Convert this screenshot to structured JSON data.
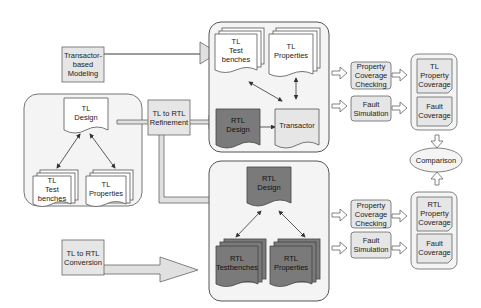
{
  "diagram": {
    "left_group": {
      "design": "TL\nDesign",
      "testbenches": "TL\nTest\nbenches",
      "properties": "TL\nProperties"
    },
    "process_boxes": {
      "transactor_modeling": "Transactor-\nbased\nModeling",
      "refinement": "TL to RTL\nRefinement",
      "conversion": "TL to RTL\nConversion"
    },
    "top_group": {
      "testbenches": "TL\nTest\nbenches",
      "properties": "TL\nProperties",
      "rtl_design": "RTL\nDesign",
      "transactor": "Transactor"
    },
    "bottom_group": {
      "rtl_design": "RTL\nDesign",
      "testbenches": "RTL\nTestbenches",
      "properties": "RTL\nProperties"
    },
    "analysis_top": {
      "property_checking": "Property\nCoverage\nChecking",
      "fault_simulation": "Fault\nSimulation"
    },
    "analysis_bottom": {
      "property_checking": "Property\nCoverage\nChecking",
      "fault_simulation": "Fault\nSimulation"
    },
    "results_top": {
      "property_coverage": "TL\nProperty\nCoverage",
      "fault_coverage": "Fault\nCoverage"
    },
    "results_bottom": {
      "property_coverage": "RTL\nProperty\nCoverage",
      "fault_coverage": "Fault\nCoverage"
    },
    "comparison": "Comparison",
    "colors": {
      "light_fill": "#e6e6e6",
      "group_fill": "#f4f4f4",
      "dark_fill": "#7a7a7a",
      "arrow_fill": "#e0e0e0",
      "stroke": "#555555"
    }
  }
}
